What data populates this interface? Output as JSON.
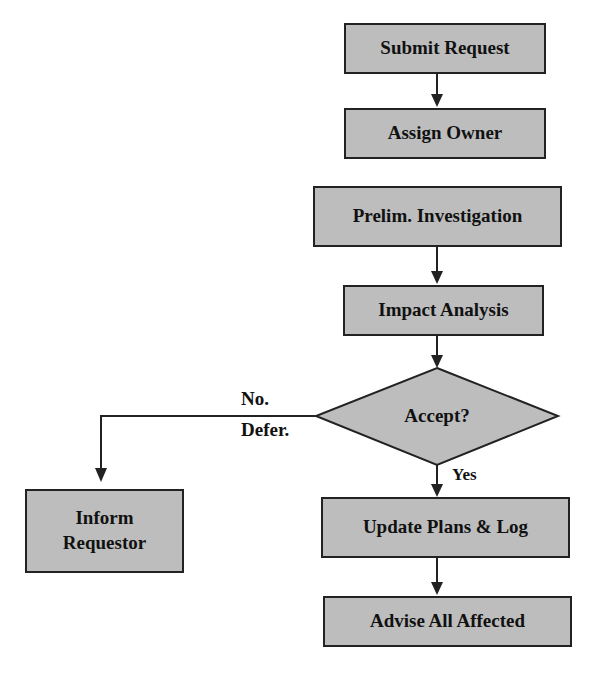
{
  "diagram": {
    "type": "flowchart",
    "colors": {
      "node_fill": "#bdbdbd",
      "stroke": "#222222",
      "text": "#111111"
    },
    "nodes": {
      "submit": {
        "label": "Submit Request",
        "shape": "rect"
      },
      "assign": {
        "label": "Assign Owner",
        "shape": "rect"
      },
      "prelim": {
        "label": "Prelim. Investigation",
        "shape": "rect"
      },
      "impact": {
        "label": "Impact Analysis",
        "shape": "rect"
      },
      "accept": {
        "label": "Accept?",
        "shape": "diamond"
      },
      "update": {
        "label": "Update Plans & Log",
        "shape": "rect"
      },
      "advise": {
        "label": "Advise All Affected",
        "shape": "rect"
      },
      "inform": {
        "label_line1": "Inform",
        "label_line2": "Requestor",
        "shape": "rect"
      }
    },
    "edge_labels": {
      "no_line1": "No.",
      "no_line2": "Defer.",
      "yes": "Yes"
    },
    "edges": [
      [
        "submit",
        "assign"
      ],
      [
        "assign",
        "prelim"
      ],
      [
        "prelim",
        "impact"
      ],
      [
        "impact",
        "accept"
      ],
      [
        "accept",
        "update",
        "Yes"
      ],
      [
        "accept",
        "inform",
        "No. Defer."
      ],
      [
        "update",
        "advise"
      ]
    ]
  }
}
